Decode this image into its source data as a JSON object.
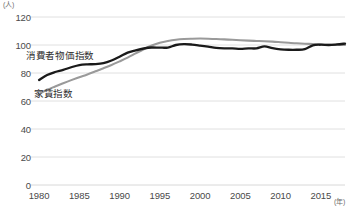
{
  "axes": {
    "y_unit": "(人)",
    "x_unit": "(年)",
    "y_ticks": [
      0,
      20,
      40,
      60,
      80,
      100,
      120
    ],
    "x_ticks": [
      1980,
      1985,
      1990,
      1995,
      2000,
      2005,
      2010,
      2015
    ]
  },
  "labels": {
    "cpi": "消費者物価指数",
    "rent": "家賃指数"
  },
  "colors": {
    "cpi_line": "#1a1a1a",
    "rent_line": "#9a9a9a",
    "grid": "#d8d8d8",
    "text": "#4a4a4a"
  },
  "chart_data": {
    "type": "line",
    "title": "",
    "xlabel": "(年)",
    "ylabel": "(人)",
    "xlim": [
      1979,
      2018
    ],
    "ylim": [
      0,
      120
    ],
    "grid": true,
    "legend": "inline-annotations",
    "x": [
      1980,
      1981,
      1982,
      1983,
      1984,
      1985,
      1986,
      1987,
      1988,
      1989,
      1990,
      1991,
      1992,
      1993,
      1994,
      1995,
      1996,
      1997,
      1998,
      1999,
      2000,
      2001,
      2002,
      2003,
      2004,
      2005,
      2006,
      2007,
      2008,
      2009,
      2010,
      2011,
      2012,
      2013,
      2014,
      2015,
      2016,
      2017,
      2018
    ],
    "series": [
      {
        "name": "消費者物価指数",
        "color": "#1a1a1a",
        "values": [
          75.0,
          78.6,
          80.7,
          82.2,
          84.1,
          85.7,
          86.2,
          86.3,
          87.0,
          88.9,
          91.6,
          94.6,
          96.2,
          97.5,
          98.2,
          98.1,
          98.2,
          100.0,
          100.6,
          100.3,
          99.6,
          98.8,
          97.9,
          97.6,
          97.6,
          97.3,
          97.6,
          97.6,
          99.0,
          97.7,
          96.9,
          96.6,
          96.6,
          97.0,
          99.8,
          100.2,
          100.0,
          100.4,
          101.0
        ]
      },
      {
        "name": "家賃指数",
        "color": "#9a9a9a",
        "values": [
          65.0,
          68.0,
          70.4,
          72.7,
          74.9,
          77.0,
          79.0,
          81.2,
          83.4,
          85.7,
          88.3,
          91.0,
          94.0,
          97.0,
          99.6,
          101.6,
          102.9,
          103.8,
          104.3,
          104.5,
          104.6,
          104.5,
          104.3,
          104.0,
          103.7,
          103.4,
          103.1,
          102.9,
          102.7,
          102.4,
          102.0,
          101.6,
          101.2,
          100.9,
          100.7,
          100.4,
          100.2,
          100.1,
          100.0
        ]
      }
    ]
  }
}
